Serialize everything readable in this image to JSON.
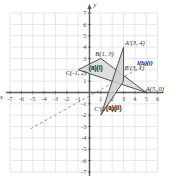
{
  "figure": {
    "axis_label_x": "x",
    "axis_label_y": "y"
  },
  "axes": {
    "x_ticks": [
      "-7",
      "-6",
      "-5",
      "-4",
      "-3",
      "-2",
      "-1",
      "1",
      "2",
      "3",
      "4",
      "5",
      "6"
    ],
    "y_ticks_positive": [
      "7",
      "6",
      "5",
      "4",
      "3",
      "2",
      "1"
    ],
    "y_ticks_negative": [
      "-1",
      "-2",
      "-3",
      "-4",
      "-5",
      "-6",
      "-7"
    ],
    "xmin": -7,
    "xmax": 6,
    "ymin": -7,
    "ymax": 7,
    "grid": true
  },
  "labels": {
    "A_prime": "A'(3, 4)",
    "B": "B(1, 3)",
    "C": "C(-1, 2)",
    "A": "A(5, 0)",
    "B_prime": "B'(3, 1)",
    "C_prime": "C'(1, -2)",
    "line_l": "l(b)(i)",
    "region_ai": "(a)(i)",
    "region_aii": "(a)(ii)"
  },
  "chart_data": {
    "type": "scatter",
    "title": "Triangle transformations on the coordinate plane",
    "xlabel": "x",
    "ylabel": "y",
    "xlim": [
      -7,
      6
    ],
    "ylim": [
      -7,
      7
    ],
    "grid": true,
    "shapes": [
      {
        "name": "triangle-original",
        "label": "(a)(i)",
        "vertices": [
          {
            "name": "A",
            "x": 5,
            "y": 0,
            "label": "A(5, 0)"
          },
          {
            "name": "B",
            "x": 1,
            "y": 3,
            "label": "B(1, 3)"
          },
          {
            "name": "C",
            "x": -1,
            "y": 2,
            "label": "C(-1, 2)"
          }
        ],
        "fill": "#d9d9d9",
        "stroke": "#4a4a4a"
      },
      {
        "name": "triangle-image",
        "label": "(a)(ii)",
        "vertices": [
          {
            "name": "A'",
            "x": 3,
            "y": 4,
            "label": "A'(3, 4)"
          },
          {
            "name": "B'",
            "x": 3,
            "y": 1,
            "label": "B'(3, 1)"
          },
          {
            "name": "C'",
            "x": 1,
            "y": -2,
            "label": "C'(1, -2)"
          }
        ],
        "fill": "#cfcfcf",
        "stroke": "#4a4a4a"
      }
    ],
    "lines": [
      {
        "name": "mirror-line-l",
        "label": "l(b)(i)",
        "style": "dashed",
        "from": {
          "x": -5.2,
          "y": -3.2
        },
        "to": {
          "x": 5.2,
          "y": 2.6
        }
      }
    ]
  },
  "colors": {
    "grid": "#dcdde1",
    "axis": "#5a5a5a",
    "shape_fill": "#d4d4d4",
    "shape_stroke": "#4f4f4f",
    "text": "#2b2b2b"
  }
}
